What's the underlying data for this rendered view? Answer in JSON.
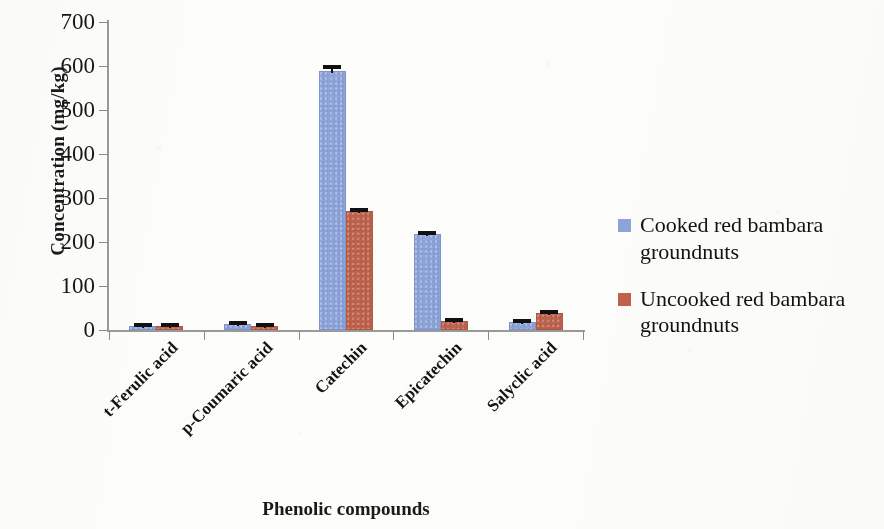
{
  "chart_data": {
    "type": "bar",
    "title": "",
    "xlabel": "Phenolic compounds",
    "ylabel": "Concentration (mg/kg)",
    "ylim": [
      0,
      700
    ],
    "ytick_step": 100,
    "yticks": [
      "700",
      "600",
      "500",
      "400",
      "300",
      "200",
      "100",
      "0"
    ],
    "grid": false,
    "legend_position": "right",
    "categories": [
      "t-Ferulic acid",
      "p-Coumaric acid",
      "Catechin",
      "Epicatechin",
      "Salyclic acid"
    ],
    "series": [
      {
        "name": "Cooked red bambara groundnuts",
        "color": "#8ea5db",
        "values": [
          5,
          8,
          583,
          214,
          14
        ],
        "errors": [
          2,
          2,
          14,
          4,
          3
        ]
      },
      {
        "name": "Uncooked red bambara groundnuts",
        "color": "#c0634d",
        "values": [
          3,
          5,
          267,
          17,
          33
        ],
        "errors": [
          2,
          2,
          5,
          3,
          3
        ]
      }
    ]
  },
  "axes": {
    "y_title": "Concentration (mg/kg)",
    "x_title": "Phenolic compounds",
    "y_tick_labels": [
      "700",
      "600",
      "500",
      "400",
      "300",
      "200",
      "100",
      "0"
    ],
    "x_tick_labels": [
      "t-Ferulic acid",
      "p-Coumaric acid",
      "Catechin",
      "Epicatechin",
      "Salyclic acid"
    ]
  },
  "legend": {
    "items": [
      {
        "label_line1": "Cooked red bambara",
        "label_line2": "groundnuts",
        "color": "#8ea5db"
      },
      {
        "label_line1": "Uncooked red bambara",
        "label_line2": "groundnuts",
        "color": "#c0634d"
      }
    ]
  }
}
